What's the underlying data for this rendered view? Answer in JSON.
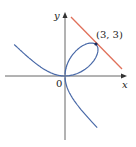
{
  "chart_data": {
    "type": "line",
    "title": "",
    "xlabel": "x",
    "ylabel": "y",
    "origin_label": "0",
    "series": [
      {
        "name": "curve",
        "equation": "x^3 + y^3 = 6xy",
        "color": "#4a6aa8"
      },
      {
        "name": "tangent line at (3,3)",
        "equation": "y = -x + 6",
        "color": "#e0705a"
      }
    ],
    "annotations": [
      {
        "text": "(3, 3)",
        "x": 3,
        "y": 3
      }
    ],
    "grid": false
  },
  "labels": {
    "x_axis": "x",
    "y_axis": "y",
    "origin": "0",
    "point": "(3, 3)"
  },
  "colors": {
    "curve": "#4a6aa8",
    "tangent": "#e0705a",
    "axis": "#555555"
  }
}
